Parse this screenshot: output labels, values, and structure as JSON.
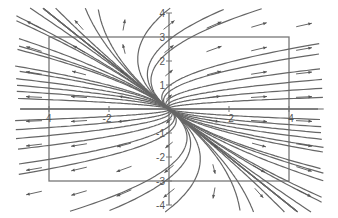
{
  "chart_data": {
    "type": "vector_field",
    "title": "",
    "xlabel": "",
    "ylabel": "",
    "xlim": [
      -4.2,
      4.2
    ],
    "ylim": [
      -4,
      4
    ],
    "frame_box": {
      "x": [
        -4,
        4
      ],
      "y": [
        -3,
        3
      ]
    },
    "grid": false,
    "legend": null,
    "system": {
      "dx": "2x + y",
      "dy": "y",
      "matrix": [
        [
          2,
          1
        ],
        [
          0,
          1
        ]
      ],
      "equilibrium": [
        0,
        0
      ],
      "classification": "unstable node (source)"
    },
    "x_ticks": [
      {
        "value": -4,
        "label": "-4"
      },
      {
        "value": -2,
        "label": "-2"
      },
      {
        "value": 2,
        "label": "2"
      },
      {
        "value": 4,
        "label": "4"
      }
    ],
    "y_ticks": [
      {
        "value": 4,
        "label": "4"
      },
      {
        "value": 3,
        "label": "3"
      },
      {
        "value": 2,
        "label": "2"
      },
      {
        "value": 1,
        "label": "1"
      },
      {
        "value": -1,
        "label": "-1"
      },
      {
        "value": -2,
        "label": "-2"
      },
      {
        "value": -3,
        "label": "-3"
      },
      {
        "value": -4,
        "label": "-4"
      }
    ],
    "trajectory_params": {
      "c_values": [
        -2.5,
        -1.2,
        -0.6,
        -0.25,
        0.25,
        0.6,
        1.2,
        2.5
      ],
      "a_values": [
        -1.5,
        -0.5,
        -0.15,
        0,
        0.15,
        0.5,
        1.5
      ]
    },
    "arrow_grid": {
      "x": [
        -4.5,
        -3,
        -1.5,
        0,
        1.5,
        3,
        4.5
      ],
      "y": [
        -3.5,
        -2.5,
        -1.5,
        -0.5,
        0.5,
        1.5,
        2.5,
        3.5
      ]
    },
    "colors": {
      "axis": "#777777",
      "curve": "#666666",
      "arrow": "#555555",
      "frame": "#777777"
    }
  }
}
